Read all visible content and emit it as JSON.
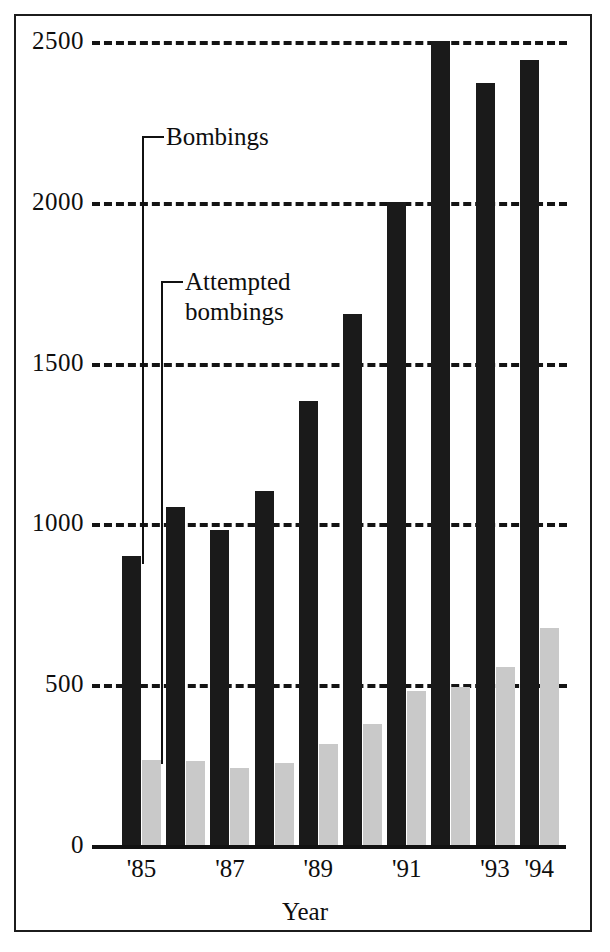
{
  "chart_data": {
    "type": "bar",
    "title": "",
    "subtitle": "",
    "xlabel": "Year",
    "ylabel": "",
    "ylim": [
      0,
      2500
    ],
    "yticks": [
      0,
      500,
      1000,
      1500,
      2000,
      2500
    ],
    "ytick_labels": [
      "0",
      "500",
      "1000",
      "1500",
      "2000",
      "2500"
    ],
    "grid": "horizontal-dashed",
    "legend_position": "inline-callouts",
    "categories": [
      "'85",
      "'86",
      "'87",
      "'88",
      "'89",
      "'90",
      "'91",
      "'92",
      "'93",
      "'94"
    ],
    "xtick_labels_shown": [
      "'85",
      "'87",
      "'89",
      "'91",
      "'93",
      "'94"
    ],
    "series": [
      {
        "name": "Bombings",
        "color": "#1a1a1a",
        "values": [
          900,
          1050,
          980,
          1100,
          1380,
          1650,
          2000,
          2500,
          2370,
          2440
        ]
      },
      {
        "name": "Attempted bombings",
        "color": "#c9c9c9",
        "values": [
          265,
          260,
          240,
          255,
          315,
          375,
          480,
          490,
          555,
          675
        ]
      }
    ],
    "annotations": [
      {
        "text": "Bombings",
        "points_to_series": "Bombings",
        "points_to_category": "'85"
      },
      {
        "text": "Attempted\nbombings",
        "points_to_series": "Attempted bombings",
        "points_to_category": "'85"
      }
    ]
  },
  "axis": {
    "x_title": "Year"
  }
}
